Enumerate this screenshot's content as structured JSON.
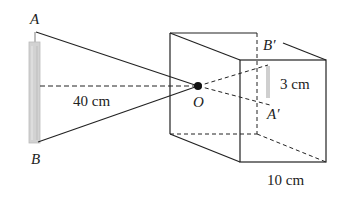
{
  "figure": {
    "type": "pinhole camera diagram",
    "labels": {
      "A": "A",
      "B": "B",
      "O": "O",
      "A_prime": "A′",
      "B_prime": "B′"
    },
    "measurements": {
      "object_distance": "40 cm",
      "image_height": "3 cm",
      "box_depth": "10 cm"
    },
    "colors": {
      "line": "#222222",
      "candle": "#cfcfcf",
      "background": "#ffffff"
    }
  }
}
